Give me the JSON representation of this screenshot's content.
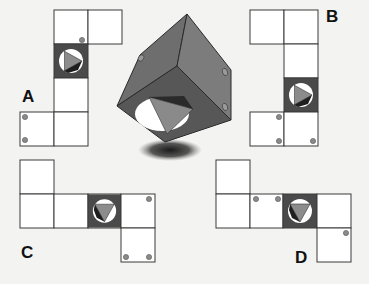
{
  "puzzle": {
    "type": "cube-net-matching",
    "cube": {
      "description": "3D cube with a circular opening showing a triangle on the front face, one dot on the left face, two dots on the right face",
      "colors": {
        "left_face": "#6b6b6b",
        "right_face": "#7a7a7a",
        "front_face": "#555555",
        "shadow": "#2a2a2a"
      }
    },
    "options": [
      {
        "label": "A",
        "special_face_triangle": "pointing-right"
      },
      {
        "label": "B",
        "special_face_triangle": "pointing-right"
      },
      {
        "label": "C",
        "special_face_triangle": "pointing-down"
      },
      {
        "label": "D",
        "special_face_triangle": "pointing-down"
      }
    ]
  }
}
